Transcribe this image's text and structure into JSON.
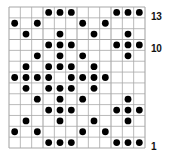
{
  "chart": {
    "type": "knitting-colorwork-chart",
    "columns": 12,
    "rows": 13,
    "row_numbering": "bottom-to-top",
    "colors": {
      "background": "#ffffff",
      "grid_line": "#a8a8a8",
      "stitch_dot": "#000000",
      "label": "#111111"
    },
    "row_labels": [
      {
        "row": 13,
        "text": "13"
      },
      {
        "row": 10,
        "text": "10"
      },
      {
        "row": 1,
        "text": "1"
      }
    ],
    "grid": [
      {
        "row": 13,
        "cells": "...###...###"
      },
      {
        "row": 12,
        "cells": "#.#...#.#..."
      },
      {
        "row": 11,
        "cells": ".#..#..#..#."
      },
      {
        "row": 10,
        "cells": "...###...###"
      },
      {
        "row": 9,
        "cells": "..#.#.#...#."
      },
      {
        "row": 8,
        "cells": ".#.###.#...."
      },
      {
        "row": 7,
        "cells": "####.####..."
      },
      {
        "row": 6,
        "cells": ".#.###.#...."
      },
      {
        "row": 5,
        "cells": "..#.#.#...#."
      },
      {
        "row": 4,
        "cells": "...###...###"
      },
      {
        "row": 3,
        "cells": ".#..#..#..#."
      },
      {
        "row": 2,
        "cells": "#.#...#.#..."
      },
      {
        "row": 1,
        "cells": "...###...###"
      }
    ]
  }
}
